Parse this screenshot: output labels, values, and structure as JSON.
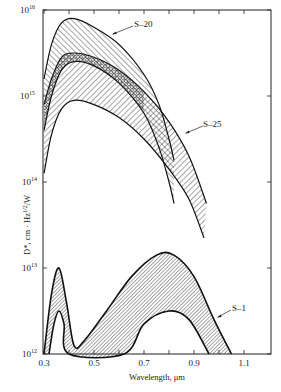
{
  "chart_data": {
    "type": "area",
    "title": "",
    "xlabel": "Wavelength, μm",
    "ylabel": "D*, cm · Hz^1/2/W",
    "xlim": [
      0.3,
      1.2
    ],
    "ylim_log10": [
      12,
      16
    ],
    "yscale": "log",
    "grid": false,
    "legend": "inline labels with leader arrows",
    "x_ticks": [
      0.3,
      0.4,
      0.5,
      0.6,
      0.7,
      0.8,
      0.9,
      1.0,
      1.1
    ],
    "x_tick_labels": [
      "0.3",
      "0.5",
      "0.7",
      "0.9",
      "1.1"
    ],
    "y_tick_labels": [
      {
        "base": "10",
        "exp": "16"
      },
      {
        "base": "10",
        "exp": "15"
      },
      {
        "base": "10",
        "exp": "14"
      },
      {
        "base": "10",
        "exp": "13"
      },
      {
        "base": "10",
        "exp": "12"
      }
    ],
    "series": [
      {
        "name": "S-20",
        "fill": "diagonal hatch (/)",
        "upper": {
          "x": [
            0.3,
            0.33,
            0.37,
            0.42,
            0.5,
            0.6,
            0.7,
            0.76,
            0.8,
            0.82
          ],
          "log10_D": [
            15.2,
            15.6,
            15.85,
            15.9,
            15.8,
            15.6,
            15.25,
            14.9,
            14.5,
            14.25
          ]
        },
        "lower": {
          "x": [
            0.3,
            0.33,
            0.37,
            0.42,
            0.5,
            0.6,
            0.7,
            0.76,
            0.8,
            0.82
          ],
          "log10_D": [
            14.6,
            15.0,
            15.3,
            15.4,
            15.35,
            15.15,
            14.8,
            14.4,
            14.0,
            13.75
          ]
        }
      },
      {
        "name": "S-25",
        "fill": "back-diagonal hatch (\\)",
        "upper": {
          "x": [
            0.3,
            0.33,
            0.37,
            0.42,
            0.5,
            0.6,
            0.7,
            0.8,
            0.88,
            0.95
          ],
          "log10_D": [
            14.9,
            15.2,
            15.45,
            15.5,
            15.45,
            15.3,
            15.05,
            14.7,
            14.3,
            13.75
          ]
        },
        "lower": {
          "x": [
            0.3,
            0.33,
            0.37,
            0.42,
            0.5,
            0.6,
            0.7,
            0.8,
            0.88,
            0.94
          ],
          "log10_D": [
            14.1,
            14.55,
            14.85,
            14.95,
            14.9,
            14.75,
            14.5,
            14.15,
            13.8,
            13.35
          ]
        }
      },
      {
        "name": "S-1",
        "fill": "dense diagonal hatch",
        "upper": {
          "x": [
            0.3,
            0.33,
            0.36,
            0.39,
            0.42,
            0.46,
            0.55,
            0.65,
            0.75,
            0.82,
            0.9,
            0.98,
            1.05
          ],
          "log10_D": [
            12.0,
            12.7,
            13.0,
            12.6,
            12.1,
            12.15,
            12.5,
            12.9,
            13.15,
            13.15,
            12.9,
            12.4,
            12.0
          ]
        },
        "lower": {
          "x": [
            0.32,
            0.34,
            0.36,
            0.38,
            0.4,
            0.62,
            0.7,
            0.8,
            0.88,
            0.96
          ],
          "log10_D": [
            12.0,
            12.35,
            12.5,
            12.35,
            12.0,
            12.0,
            12.35,
            12.5,
            12.4,
            12.0
          ]
        }
      }
    ],
    "overlap_region": "S-20 lower band overlapping S-25 upper band shown with crosshatch",
    "annotations": [
      "S-20",
      "S-25",
      "S-1"
    ]
  },
  "labels": {
    "s20": "S–20",
    "s25": "S–25",
    "s1": "S–1",
    "xlabel": "Wavelength, μm",
    "ylabel_main": "D*, cm · Hz",
    "ylabel_sup": "1/2",
    "ylabel_tail": "/W"
  }
}
